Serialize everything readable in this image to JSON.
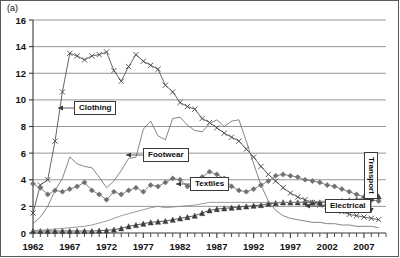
{
  "figure": {
    "panel_label": "(a)",
    "background": "#ffffff",
    "frame_color": "#5a5a5a"
  },
  "chart_data": {
    "type": "line",
    "title": "",
    "subtitle": "",
    "xlabel": "",
    "ylabel": "",
    "xlim": [
      1962,
      2010
    ],
    "ylim": [
      0,
      16
    ],
    "yticks": [
      0,
      2,
      4,
      6,
      8,
      10,
      12,
      14,
      16
    ],
    "xticks": [
      1962,
      1967,
      1972,
      1977,
      1982,
      1987,
      1992,
      1997,
      2002,
      2007
    ],
    "xtick_labels": [
      "1962",
      "1967",
      "1972",
      "1977",
      "1982",
      "1987",
      "1992",
      "1997",
      "2002",
      "2007"
    ],
    "ytick_labels": [
      "0",
      "2",
      "4",
      "6",
      "8",
      "10",
      "12",
      "14",
      "16"
    ],
    "x_minor_tick_step": 1,
    "grid": "horizontal",
    "grid_color": "#8a8a8a",
    "legend": "inline-callouts",
    "legend_position": "inline",
    "x": [
      1962,
      1963,
      1964,
      1965,
      1966,
      1967,
      1968,
      1969,
      1970,
      1971,
      1972,
      1973,
      1974,
      1975,
      1976,
      1977,
      1978,
      1979,
      1980,
      1981,
      1982,
      1983,
      1984,
      1985,
      1986,
      1987,
      1988,
      1989,
      1990,
      1991,
      1992,
      1993,
      1994,
      1995,
      1996,
      1997,
      1998,
      1999,
      2000,
      2001,
      2002,
      2003,
      2004,
      2005,
      2006,
      2007,
      2008,
      2009
    ],
    "series": [
      {
        "name": "Clothing",
        "marker": "x",
        "color": "#4a4a4a",
        "values": [
          1.5,
          3.6,
          4.0,
          6.9,
          10.6,
          13.5,
          13.3,
          13.0,
          13.3,
          13.4,
          13.6,
          12.2,
          11.4,
          12.5,
          13.4,
          12.9,
          12.6,
          12.3,
          11.1,
          10.6,
          9.8,
          9.5,
          9.3,
          8.6,
          8.3,
          7.9,
          7.5,
          7.2,
          6.9,
          6.3,
          5.7,
          5.0,
          4.4,
          3.9,
          3.4,
          3.0,
          2.7,
          2.5,
          2.3,
          2.1,
          2.0,
          1.8,
          1.6,
          1.4,
          1.3,
          1.2,
          1.1,
          1.0
        ]
      },
      {
        "name": "Footwear",
        "marker": "none",
        "color": "#6f6f6f",
        "values": [
          0.7,
          1.2,
          2.0,
          3.2,
          4.1,
          5.7,
          5.2,
          5.0,
          4.9,
          4.2,
          3.4,
          3.9,
          4.7,
          5.6,
          5.7,
          7.8,
          8.4,
          7.3,
          7.0,
          8.6,
          8.7,
          8.1,
          7.7,
          7.6,
          8.2,
          8.5,
          8.0,
          8.4,
          8.5,
          6.9,
          5.2,
          3.6,
          2.4,
          1.7,
          1.3,
          1.1,
          1.0,
          0.9,
          0.8,
          0.8,
          0.7,
          0.7,
          0.6,
          0.6,
          0.5,
          0.5,
          0.5,
          0.4
        ]
      },
      {
        "name": "Textiles",
        "marker": "diamond",
        "color": "#707070",
        "values": [
          3.7,
          3.4,
          2.9,
          3.2,
          3.1,
          3.3,
          3.5,
          3.8,
          3.2,
          2.9,
          2.5,
          3.1,
          2.9,
          3.2,
          3.4,
          3.1,
          3.6,
          3.5,
          3.8,
          4.1,
          4.0,
          3.5,
          3.7,
          4.2,
          4.6,
          4.4,
          4.1,
          3.5,
          3.2,
          3.1,
          3.3,
          3.6,
          3.9,
          4.3,
          4.4,
          4.3,
          4.2,
          4.0,
          3.9,
          3.8,
          3.6,
          3.5,
          3.3,
          3.1,
          2.9,
          2.7,
          2.5,
          2.4
        ]
      },
      {
        "name": "Electrical",
        "marker": "triangle",
        "color": "#3d3d3d",
        "values": [
          0.15,
          0.15,
          0.15,
          0.15,
          0.15,
          0.15,
          0.15,
          0.15,
          0.15,
          0.18,
          0.2,
          0.25,
          0.35,
          0.5,
          0.6,
          0.7,
          0.8,
          0.85,
          0.9,
          1.0,
          1.1,
          1.2,
          1.3,
          1.5,
          1.7,
          1.8,
          1.85,
          1.9,
          1.95,
          2.0,
          2.05,
          2.1,
          2.2,
          2.25,
          2.3,
          2.3,
          2.3,
          2.3,
          2.3,
          2.3,
          2.32,
          2.35,
          2.4,
          2.45,
          2.5,
          2.55,
          2.6,
          2.75
        ]
      },
      {
        "name": "Transport",
        "marker": "none",
        "color": "#8a8a8a",
        "values": [
          0.2,
          0.2,
          0.25,
          0.3,
          0.35,
          0.4,
          0.45,
          0.5,
          0.6,
          0.75,
          0.9,
          1.1,
          1.3,
          1.45,
          1.6,
          1.75,
          1.9,
          2.0,
          1.9,
          1.95,
          2.0,
          2.05,
          2.1,
          2.2,
          2.3,
          2.3,
          2.3,
          2.3,
          2.3,
          2.3,
          2.3,
          2.3,
          2.3,
          2.3,
          2.3,
          2.3,
          2.3,
          2.32,
          2.35,
          2.38,
          2.4,
          2.42,
          2.45,
          2.5,
          2.55,
          2.6,
          2.65,
          2.7
        ]
      }
    ]
  },
  "callouts": {
    "clothing": "Clothing",
    "footwear": "Footwear",
    "textiles": "Textiles",
    "electrical": "Electrical",
    "transport": "Transport"
  }
}
